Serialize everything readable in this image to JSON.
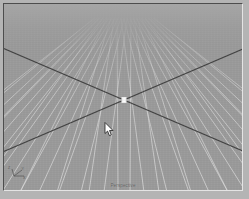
{
  "app": {
    "kind": "3d-modeling-viewport",
    "window_background": "#b4b4b4"
  },
  "viewport": {
    "label": "Perspective",
    "background_color": "#9b9b9b",
    "grid_line_color": "#c8c8c8",
    "grid_major_line_color": "#d6d6d6",
    "axis_line_color": "#3c3c3c",
    "frame_shadow_color": "#4d4d4d",
    "frame_highlight_color": "#e4e4e4",
    "width_px": 240,
    "height_px": 188,
    "center_marker": {
      "name": "grid-origin-marker",
      "x": 120,
      "y": 96,
      "color": "#ffffff"
    },
    "horizon_y": 14
  },
  "axis_tripod": {
    "x_label": "X",
    "y_label": "Y",
    "z_label": "Z",
    "color": "#5a5a5a"
  },
  "cursor": {
    "name": "mouse-pointer",
    "x": 100,
    "y": 118,
    "fill": "#ffffff",
    "stroke": "#1e1e1e"
  },
  "chart_data": {
    "type": "line",
    "xlabel": "",
    "ylabel": "",
    "grid": {
      "cells_x": 16,
      "cells_y": 16,
      "vanishing_point_x": 120,
      "vanishing_point_y": 14,
      "origin_x": 120,
      "origin_y": 96,
      "axis_lines": [
        {
          "name": "x-axis",
          "x1": 6,
          "y1": 144,
          "x2": 236,
          "y2": 46
        },
        {
          "name": "y-axis",
          "x1": 6,
          "y1": 46,
          "x2": 236,
          "y2": 144
        }
      ]
    }
  }
}
